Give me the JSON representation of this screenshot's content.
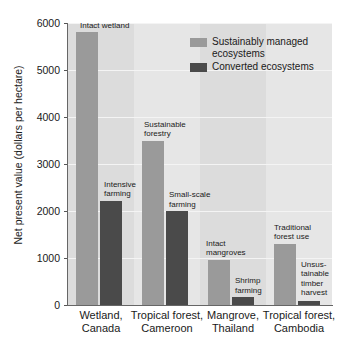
{
  "chart_data": {
    "type": "bar",
    "title": "",
    "xlabel": "",
    "ylabel": "Net present value (dollars per hectare)",
    "ylim": [
      0,
      6000
    ],
    "yticks": [
      0,
      1000,
      2000,
      3000,
      4000,
      5000,
      6000
    ],
    "ytick_labels": [
      "0",
      "1000",
      "2000",
      "3000",
      "4000",
      "5000",
      "6000"
    ],
    "grid": true,
    "legend_position": "upper-right",
    "categories": [
      "Wetland,\nCanada",
      "Tropical forest,\nCameroon",
      "Mangrove,\nThailand",
      "Tropical forest,\nCambodia"
    ],
    "series": [
      {
        "name": "Sustainably managed ecosystems",
        "color": "#9a9a9a",
        "values": [
          5800,
          3500,
          960,
          1300
        ],
        "point_labels": [
          "Intact wetland",
          "Sustainable\nforestry",
          "Intact\nmangroves",
          "Traditional\nforest use"
        ]
      },
      {
        "name": "Converted ecosystems",
        "color": "#4a4a4a",
        "values": [
          2220,
          2000,
          160,
          90
        ],
        "point_labels": [
          "Intensive\nfarming",
          "Small-scale\nfarming",
          "Shrimp\nfarming",
          "Unsus-\ntainable\ntimber\nharvest"
        ]
      }
    ],
    "legend": [
      {
        "label": "Sustainably managed\necosystems",
        "swatch": "light"
      },
      {
        "label": "Converted ecosystems",
        "swatch": "dark"
      }
    ],
    "colors": {
      "plot_background": "#dcdcdc",
      "band_alt": "#e6e6e6",
      "gridline": "#f4f4f4",
      "axis": "#666666",
      "text": "#1a1a1a"
    }
  }
}
